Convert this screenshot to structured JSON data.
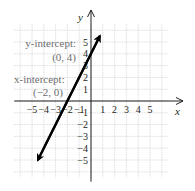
{
  "chart_data": {
    "type": "line",
    "title": "",
    "xlabel": "x",
    "ylabel": "y",
    "xlim": [
      -6.5,
      6.5
    ],
    "ylim": [
      -6.5,
      6.5
    ],
    "grid": true,
    "x_ticks": [
      "-5",
      "-4",
      "-3",
      "-2",
      "-1",
      "1",
      "2",
      "3",
      "4",
      "5"
    ],
    "y_ticks": [
      "5",
      "4",
      "3",
      "2",
      "1",
      "-1",
      "-2",
      "-3",
      "-4",
      "-5"
    ],
    "series": [
      {
        "name": "line",
        "equation": "y = 2x + 4",
        "x": [
          -4.5,
          0.75
        ],
        "y": [
          -5,
          5.5
        ],
        "color": "#000000"
      }
    ],
    "annotations": [
      {
        "label": "y-intercept:",
        "point": "(0, 4)",
        "x": 0,
        "y": 4
      },
      {
        "label": "x-intercept:",
        "point": "(−2, 0)",
        "x": -2,
        "y": 0
      }
    ]
  },
  "axes": {
    "x_label": "x",
    "y_label": "y"
  },
  "ticks": {
    "x": [
      {
        "v": -5,
        "t": "−5"
      },
      {
        "v": -4,
        "t": "−4"
      },
      {
        "v": -3,
        "t": "−3"
      },
      {
        "v": -2,
        "t": "−2"
      },
      {
        "v": -1,
        "t": "−1"
      },
      {
        "v": 1,
        "t": "1"
      },
      {
        "v": 2,
        "t": "2"
      },
      {
        "v": 3,
        "t": "3"
      },
      {
        "v": 4,
        "t": "4"
      },
      {
        "v": 5,
        "t": "5"
      }
    ],
    "y": [
      {
        "v": 5,
        "t": "5"
      },
      {
        "v": 4,
        "t": "4"
      },
      {
        "v": 3,
        "t": "3"
      },
      {
        "v": 2,
        "t": "2"
      },
      {
        "v": 1,
        "t": "1"
      },
      {
        "v": -1,
        "t": "−1"
      },
      {
        "v": -2,
        "t": "−2"
      },
      {
        "v": -3,
        "t": "−3"
      },
      {
        "v": -4,
        "t": "−4"
      },
      {
        "v": -5,
        "t": "−5"
      }
    ]
  },
  "annotations": {
    "y_intercept_label": "y-intercept:",
    "y_intercept_point": "(0, 4)",
    "x_intercept_label": "x-intercept:",
    "x_intercept_point": "(−2, 0)"
  },
  "colors": {
    "grid": "#c8c8c8",
    "axis": "#231f20",
    "line": "#000000",
    "annotation": "#6d6e71"
  }
}
